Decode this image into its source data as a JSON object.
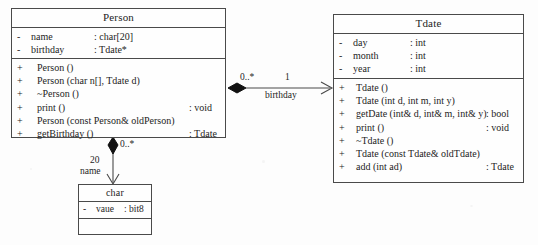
{
  "diagram": {
    "type": "uml-class-diagram",
    "background_color": "#fdfdfd",
    "line_color": "#4a4a4a"
  },
  "classes": {
    "person": {
      "name": "Person",
      "attributes": [
        {
          "visibility": "-",
          "name": "name",
          "type": ": char[20]"
        },
        {
          "visibility": "-",
          "name": "birthday",
          "type": ": Tdate*"
        }
      ],
      "operations": [
        {
          "visibility": "+",
          "name": "Person ()",
          "type": ""
        },
        {
          "visibility": "+",
          "name": "Person (char n[], Tdate d)",
          "type": ""
        },
        {
          "visibility": "+",
          "name": "~Person ()",
          "type": ""
        },
        {
          "visibility": "+",
          "name": "print ()",
          "type": ": void"
        },
        {
          "visibility": "+",
          "name": "Person (const Person& oldPerson)",
          "type": ""
        },
        {
          "visibility": "+",
          "name": "getBirthday ()",
          "type": ": Tdate"
        }
      ]
    },
    "tdate": {
      "name": "Tdate",
      "attributes": [
        {
          "visibility": "-",
          "name": "day",
          "type": ": int"
        },
        {
          "visibility": "-",
          "name": "month",
          "type": ": int"
        },
        {
          "visibility": "-",
          "name": "year",
          "type": ": int"
        }
      ],
      "operations": [
        {
          "visibility": "+",
          "name": "Tdate ()",
          "type": ""
        },
        {
          "visibility": "+",
          "name": "Tdate (int d, int m, int y)",
          "type": ""
        },
        {
          "visibility": "+",
          "name": "getDate (int& d, int& m, int& y)",
          "type": ": bool"
        },
        {
          "visibility": "+",
          "name": "print ()",
          "type": ": void"
        },
        {
          "visibility": "+",
          "name": "~Tdate ()",
          "type": ""
        },
        {
          "visibility": "+",
          "name": "Tdate (const Tdate& oldTdate)",
          "type": ""
        },
        {
          "visibility": "+",
          "name": "add (int ad)",
          "type": ": Tdate"
        }
      ]
    },
    "char": {
      "name": "char",
      "attributes": [
        {
          "visibility": "-",
          "name": "vaue",
          "type": ": bit8"
        }
      ],
      "operations": []
    }
  },
  "associations": {
    "person_tdate": {
      "source_multiplicity": "0..*",
      "target_multiplicity": "1",
      "role": "birthday"
    },
    "person_char": {
      "source_multiplicity": "0..*",
      "target_multiplicity": "20",
      "role": "name"
    }
  }
}
